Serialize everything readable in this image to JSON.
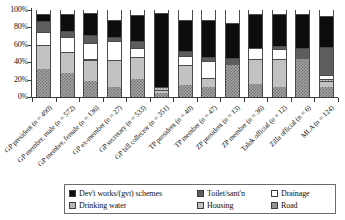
{
  "chart_data": {
    "type": "bar",
    "subtype": "stacked-100-percent",
    "title": "",
    "xlabel": "",
    "ylabel": "",
    "ylim": [
      0,
      100
    ],
    "ytick_labels": [
      "0%",
      "20%",
      "40%",
      "60%",
      "80%",
      "100%"
    ],
    "ytick_values": [
      0,
      20,
      40,
      60,
      80,
      100
    ],
    "grid": false,
    "legend_position": "bottom",
    "categories": [
      "GP president (n = 490)",
      "GP member, male (n = 572)",
      "GP member, female (n = 136)",
      "GP ex-member (n = 27)",
      "GP secretary (n = 533)",
      "GP bill collector (n = 351)",
      "TP president (n = 40)",
      "TP member (n = 47)",
      "ZP president (n = 13)",
      "ZP member (n = 36)",
      "Taluk official (n = 12)",
      "Zilla official (n = 6)",
      "MLA (n = 124)"
    ],
    "series": [
      {
        "name": "Road",
        "key": "road",
        "values": [
          32,
          28,
          18,
          12,
          21,
          5,
          14,
          12,
          37,
          15,
          11,
          44,
          11
        ]
      },
      {
        "name": "Housing",
        "key": "housing",
        "values": [
          28,
          24,
          25,
          31,
          25,
          3,
          23,
          10,
          0,
          29,
          33,
          0,
          7
        ]
      },
      {
        "name": "Drinking water",
        "key": "water",
        "values": [
          0,
          0,
          1,
          0,
          0,
          4,
          0,
          0,
          0,
          0,
          0,
          0,
          3
        ]
      },
      {
        "name": "Drainage",
        "key": "drainage",
        "values": [
          15,
          17,
          18,
          21,
          10,
          0,
          10,
          19,
          0,
          12,
          11,
          0,
          4
        ]
      },
      {
        "name": "Toilet/sant'n",
        "key": "toilet",
        "values": [
          12,
          7,
          9,
          5,
          8,
          0,
          6,
          5,
          8,
          0,
          4,
          12,
          32
        ]
      },
      {
        "name": "Dev't works/(gvt) schemes",
        "key": "dev",
        "values": [
          9,
          20,
          25,
          19,
          30,
          85,
          36,
          43,
          40,
          39,
          36,
          39,
          36
        ]
      }
    ],
    "stack_order_bottom_to_top": [
      "road",
      "housing",
      "water",
      "drainage",
      "toilet",
      "dev"
    ],
    "legend": [
      {
        "label": "Dev't works/(gvt) schemes",
        "key": "dev",
        "pattern": "solid-black",
        "color": "#0d0d0d"
      },
      {
        "label": "Toilet/sant'n",
        "key": "toilet",
        "pattern": "solid-dark",
        "color": "#5d5d5d"
      },
      {
        "label": "Drainage",
        "key": "drainage",
        "pattern": "solid-white",
        "color": "#ffffff"
      },
      {
        "label": "Drinking water",
        "key": "water",
        "pattern": "check-light",
        "color": "#cfcfcf"
      },
      {
        "label": "Housing",
        "key": "housing",
        "pattern": "solid-light",
        "color": "#c2c2c2"
      },
      {
        "label": "Road",
        "key": "road",
        "pattern": "check-dark",
        "color": "#a5a5a5"
      }
    ]
  }
}
